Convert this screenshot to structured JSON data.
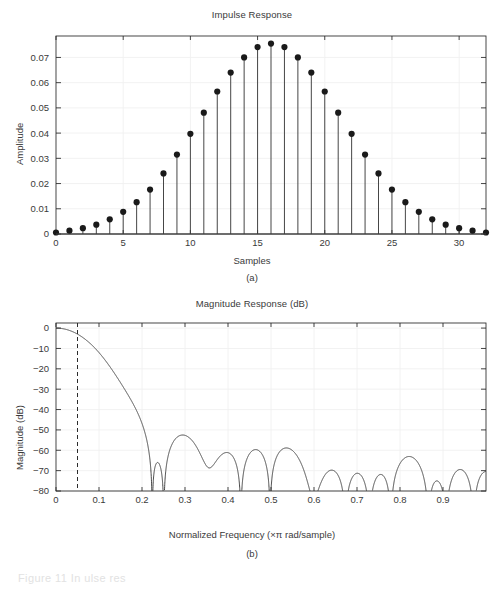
{
  "figure": {
    "background": "#ffffff",
    "axis_color": "#262626",
    "grid_color": "#f0f0f0",
    "line_color": "#3c3c3c",
    "text_color": "#3a3a3a",
    "footer_ghost_text": "Figure 11 In ulse res"
  },
  "panel_a": {
    "subcaption": "(a)",
    "chart_data": {
      "type": "line",
      "plot_style": "stem",
      "title": "Impulse Response",
      "xlabel": "Samples",
      "ylabel": "Amplitude",
      "xlim": [
        0,
        32
      ],
      "ylim": [
        0,
        0.0785
      ],
      "xticks": [
        0,
        5,
        10,
        15,
        20,
        25,
        30
      ],
      "xticklabels": [
        "0",
        "5",
        "10",
        "15",
        "20",
        "25",
        "30"
      ],
      "yticks": [
        0,
        0.01,
        0.02,
        0.03,
        0.04,
        0.05,
        0.06,
        0.07
      ],
      "yticklabels": [
        "0",
        "0.01",
        "0.02",
        "0.03",
        "0.04",
        "0.05",
        "0.06",
        "0.07"
      ],
      "grid": true,
      "legend": "none",
      "x": [
        0,
        1,
        2,
        3,
        4,
        5,
        6,
        7,
        8,
        9,
        10,
        11,
        12,
        13,
        14,
        15,
        16,
        17,
        18,
        19,
        20,
        21,
        22,
        23,
        24,
        25,
        26,
        27,
        28,
        29,
        30,
        31,
        32
      ],
      "values": [
        0.0006,
        0.0013,
        0.0023,
        0.0037,
        0.0058,
        0.0088,
        0.0126,
        0.0176,
        0.024,
        0.0315,
        0.0397,
        0.0481,
        0.0565,
        0.064,
        0.07,
        0.0741,
        0.0755,
        0.0741,
        0.07,
        0.064,
        0.0565,
        0.0481,
        0.0397,
        0.0315,
        0.024,
        0.0176,
        0.0126,
        0.0088,
        0.0058,
        0.0037,
        0.0023,
        0.0013,
        0.0006
      ],
      "marker": "filled-circle",
      "marker_size": 3.1
    }
  },
  "panel_b": {
    "subcaption": "(b)",
    "chart_data": {
      "type": "line",
      "title": "Magnitude Response (dB)",
      "xlabel": "Normalized Frequency (×π rad/sample)",
      "ylabel": "Magnitude (dB)",
      "xlim": [
        0,
        1.0
      ],
      "ylim": [
        -80,
        2.5
      ],
      "xticks": [
        0,
        0.1,
        0.2,
        0.3,
        0.4,
        0.5,
        0.6,
        0.7,
        0.8,
        0.9
      ],
      "xticklabels": [
        "0",
        "0.1",
        "0.2",
        "0.3",
        "0.4",
        "0.5",
        "0.6",
        "0.7",
        "0.8",
        "0.9"
      ],
      "yticks": [
        0,
        -10,
        -20,
        -30,
        -40,
        -50,
        -60,
        -70,
        -80
      ],
      "yticklabels": [
        "0",
        "−10",
        "−20",
        "−30",
        "−40",
        "−50",
        "−60",
        "−70",
        "−80"
      ],
      "grid": true,
      "legend": "none",
      "cursor_line": {
        "x": 0.05,
        "style": "dashed",
        "color": "#2b2b2b"
      },
      "passband_edge": 0.05,
      "stopband_start": 0.215,
      "filter": {
        "description": "FIR lowpass, 33 taps, raised-cosine-like impulse response",
        "ntaps": 33,
        "null_spacing": 0.0606,
        "first_null": 0.2166,
        "sidelobe_peaks_db": [
          -63.8,
          -59.4,
          -60.3,
          -61.4,
          -62.0,
          -62.6,
          -63.0,
          -63.4,
          -63.8,
          -64.1,
          -64.4,
          -64.7,
          -65.0,
          -65.2,
          -65.5
        ]
      }
    }
  }
}
